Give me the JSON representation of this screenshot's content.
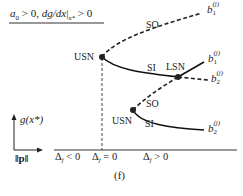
{
  "diagram": {
    "heading": "a₀ > 0, dg/dx|ₓ* > 0",
    "heading_parts": {
      "a": "a",
      "a_sub": "0",
      "gt0_1": " > 0, ",
      "dgdx": "dg/dx",
      "bar": "|",
      "x_sub": "x*",
      "gt0_2": " > 0"
    },
    "nodes": {
      "usn_upper": "USN",
      "lsn": "LSN",
      "usn_lower": "USN"
    },
    "branch_labels": {
      "so_upper": "SO",
      "si_upper": "SI",
      "so_lower": "SO",
      "si_lower": "SI"
    },
    "branch_ends": [
      {
        "base": "b",
        "sup": "(j)",
        "sub": "1",
        "style": "dashed"
      },
      {
        "base": "b",
        "sup": "(j)",
        "sub": "1",
        "style": "solid"
      },
      {
        "base": "b",
        "sup": "(j)",
        "sub": "2",
        "style": "dashed"
      },
      {
        "base": "b",
        "sup": "(j)",
        "sub": "2",
        "style": "solid"
      }
    ],
    "axis": {
      "y_label": "g(x*)",
      "x_label": "‖p‖"
    },
    "regions": [
      {
        "delta": "Δ",
        "sub": "j",
        "rel": " < 0"
      },
      {
        "delta": "Δ",
        "sub": "j",
        "rel": " = 0"
      },
      {
        "delta": "Δ",
        "sub": "j",
        "rel": " > 0"
      }
    ],
    "caption": "(f)",
    "colors": {
      "line": "#222222",
      "background": "#ffffff"
    }
  }
}
